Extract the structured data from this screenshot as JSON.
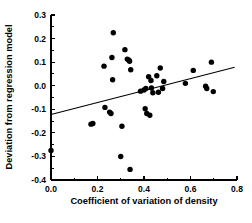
{
  "chart_data": {
    "type": "scatter",
    "title": "",
    "xlabel": "Coefficient of variation of density",
    "ylabel": "Deviation from regression model",
    "xlim": [
      0.0,
      0.8
    ],
    "ylim": [
      -0.4,
      0.3
    ],
    "xticks": [
      "0.0",
      "0.2",
      "0.4",
      "0.6",
      "0.8"
    ],
    "xtick_values": [
      0.0,
      0.2,
      0.4,
      0.6,
      0.8
    ],
    "yticks": [
      "0.3",
      "0.2",
      "0.1",
      "0.0",
      "-0.1",
      "-0.2",
      "-0.3",
      "-0.4"
    ],
    "ytick_values": [
      0.3,
      0.2,
      0.1,
      0.0,
      -0.1,
      -0.2,
      -0.3,
      -0.4
    ],
    "grid": false,
    "legend": null,
    "minor_ticks": true,
    "marker": "filled-circle",
    "marker_color": "#000000",
    "points": [
      {
        "x": 0.0,
        "y": -0.275
      },
      {
        "x": 0.172,
        "y": -0.163
      },
      {
        "x": 0.18,
        "y": -0.16
      },
      {
        "x": 0.228,
        "y": 0.083
      },
      {
        "x": 0.232,
        "y": -0.092
      },
      {
        "x": 0.252,
        "y": -0.112
      },
      {
        "x": 0.258,
        "y": -0.118
      },
      {
        "x": 0.262,
        "y": 0.12
      },
      {
        "x": 0.265,
        "y": 0.025
      },
      {
        "x": 0.268,
        "y": 0.225
      },
      {
        "x": 0.3,
        "y": -0.3
      },
      {
        "x": 0.305,
        "y": -0.172
      },
      {
        "x": 0.318,
        "y": 0.153
      },
      {
        "x": 0.328,
        "y": 0.113
      },
      {
        "x": 0.335,
        "y": 0.108
      },
      {
        "x": 0.338,
        "y": 0.104
      },
      {
        "x": 0.34,
        "y": -0.355
      },
      {
        "x": 0.343,
        "y": 0.068
      },
      {
        "x": 0.385,
        "y": -0.023
      },
      {
        "x": 0.4,
        "y": -0.018
      },
      {
        "x": 0.405,
        "y": -0.098
      },
      {
        "x": 0.408,
        "y": -0.012
      },
      {
        "x": 0.412,
        "y": -0.118
      },
      {
        "x": 0.42,
        "y": 0.038
      },
      {
        "x": 0.425,
        "y": -0.125
      },
      {
        "x": 0.43,
        "y": 0.022
      },
      {
        "x": 0.432,
        "y": -0.01
      },
      {
        "x": 0.438,
        "y": -0.03
      },
      {
        "x": 0.455,
        "y": 0.042
      },
      {
        "x": 0.462,
        "y": -0.028
      },
      {
        "x": 0.47,
        "y": 0.075
      },
      {
        "x": 0.48,
        "y": -0.012
      },
      {
        "x": 0.485,
        "y": 0.018
      },
      {
        "x": 0.578,
        "y": 0.01
      },
      {
        "x": 0.612,
        "y": 0.065
      },
      {
        "x": 0.665,
        "y": -0.002
      },
      {
        "x": 0.67,
        "y": -0.012
      },
      {
        "x": 0.69,
        "y": 0.1
      },
      {
        "x": 0.698,
        "y": -0.025
      }
    ],
    "fit_line": {
      "type": "linear-regression",
      "x_start": 0.0,
      "y_start": -0.122,
      "x_end": 0.79,
      "y_end": 0.078
    }
  }
}
